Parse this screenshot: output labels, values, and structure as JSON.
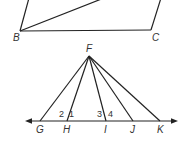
{
  "figure1": {
    "points": {
      "B": {
        "label": "B",
        "x": 20,
        "y": 31,
        "lx": 13,
        "ly": 41
      },
      "C": {
        "label": "C",
        "x": 151,
        "y": 30,
        "lx": 152,
        "ly": 41
      }
    },
    "segments": [
      {
        "name": "side-left",
        "x1": 20,
        "y1": 31,
        "x2": 29,
        "y2": -2
      },
      {
        "name": "diagonal",
        "x1": 20,
        "y1": 31,
        "x2": 104,
        "y2": -2
      },
      {
        "name": "side-bottom-BC",
        "x1": 20,
        "y1": 31,
        "x2": 151,
        "y2": 30
      },
      {
        "name": "side-right",
        "x1": 151,
        "y1": 30,
        "x2": 161,
        "y2": -2
      }
    ]
  },
  "figure2": {
    "apex": {
      "label": "F",
      "x": 89,
      "y": 56,
      "lx": 86,
      "ly": 52
    },
    "line": {
      "x1": 25,
      "x2": 178,
      "y": 121
    },
    "points": [
      {
        "label": "G",
        "x": 40,
        "lx": 36
      },
      {
        "label": "H",
        "x": 67,
        "lx": 63
      },
      {
        "label": "I",
        "x": 106,
        "lx": 104
      },
      {
        "label": "J",
        "x": 133,
        "lx": 130
      },
      {
        "label": "K",
        "x": 160,
        "lx": 157
      }
    ],
    "label_y": 133,
    "angles": [
      {
        "label": "2",
        "x": 59,
        "y": 117
      },
      {
        "label": "1",
        "x": 69,
        "y": 117
      },
      {
        "label": "3",
        "x": 97,
        "y": 117
      },
      {
        "label": "4",
        "x": 108,
        "y": 117
      }
    ]
  }
}
